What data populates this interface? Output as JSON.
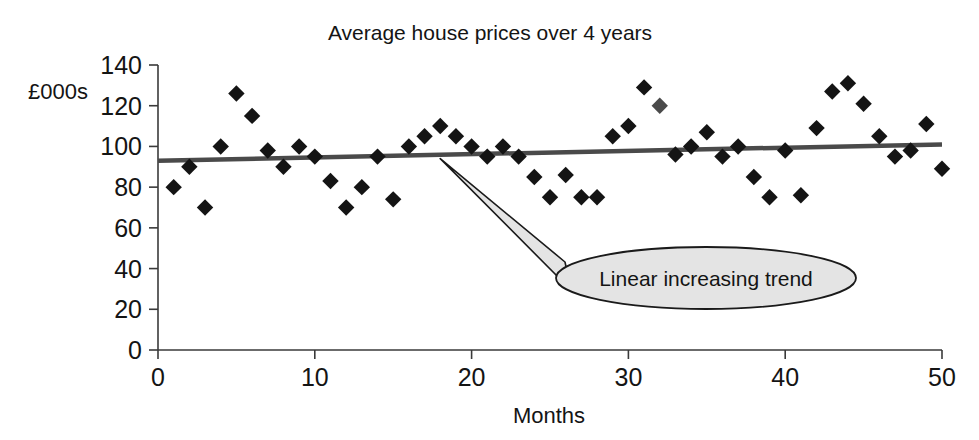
{
  "chart_data": {
    "type": "scatter",
    "title": "Average house prices over 4 years",
    "xlabel": "Months",
    "ylabel": "£000s",
    "xlim": [
      0,
      50
    ],
    "ylim": [
      0,
      140
    ],
    "xticks": [
      0,
      10,
      20,
      30,
      40,
      50
    ],
    "yticks": [
      0,
      20,
      40,
      60,
      80,
      100,
      120,
      140
    ],
    "grid": false,
    "legend": null,
    "series": [
      {
        "name": "Average house price",
        "marker": "diamond",
        "color": "#141414",
        "x": [
          1,
          2,
          3,
          4,
          5,
          6,
          7,
          8,
          9,
          10,
          11,
          12,
          13,
          14,
          15,
          16,
          17,
          18,
          19,
          20,
          21,
          22,
          23,
          24,
          25,
          26,
          27,
          28,
          29,
          30,
          31,
          32,
          33,
          34,
          35,
          36,
          37,
          38,
          39,
          40,
          41,
          42,
          43,
          44,
          45,
          46,
          47,
          48,
          49,
          50
        ],
        "y": [
          80,
          90,
          70,
          100,
          126,
          115,
          98,
          90,
          100,
          95,
          83,
          70,
          80,
          95,
          74,
          100,
          105,
          110,
          105,
          100,
          95,
          100,
          95,
          85,
          75,
          86,
          75,
          75,
          105,
          110,
          129,
          120,
          96,
          100,
          107,
          95,
          100,
          85,
          75,
          98,
          76,
          109,
          127,
          131,
          121,
          105,
          95,
          98,
          111,
          89
        ]
      }
    ],
    "trendline": {
      "label": "Linear increasing trend",
      "x_start": 0,
      "x_end": 50,
      "y_start": 93,
      "y_end": 101
    },
    "annotation": {
      "text": "Linear increasing trend",
      "pointer_x": 18,
      "pointer_y": 94
    }
  }
}
